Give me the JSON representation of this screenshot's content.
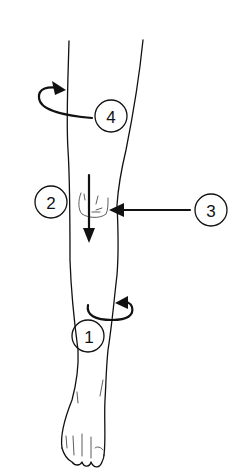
{
  "diagram": {
    "colors": {
      "ink": "#111111",
      "background": "#ffffff"
    },
    "labels": [
      {
        "id": "1",
        "text": "1",
        "meaning": "rotation arrow around lower shin"
      },
      {
        "id": "2",
        "text": "2",
        "meaning": "downward arrow over kneecap"
      },
      {
        "id": "3",
        "text": "3",
        "meaning": "horizontal arrow pointing at knee"
      },
      {
        "id": "4",
        "text": "4",
        "meaning": "rotation arrow around thigh"
      }
    ]
  }
}
